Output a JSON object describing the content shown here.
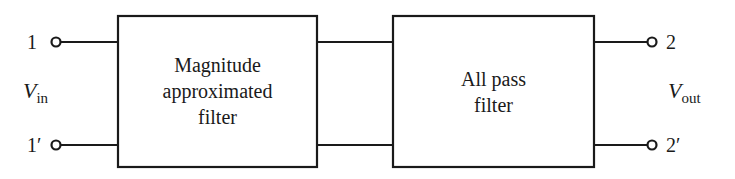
{
  "diagram": {
    "blocks": [
      {
        "id": "magnitude",
        "lines": [
          "Magnitude",
          "approximated",
          "filter"
        ]
      },
      {
        "id": "allpass",
        "lines": [
          "All pass",
          "filter"
        ]
      }
    ],
    "input": {
      "top_terminal": "1",
      "bottom_terminal": "1′",
      "voltage": "V",
      "voltage_sub": "in"
    },
    "output": {
      "top_terminal": "2",
      "bottom_terminal": "2′",
      "voltage": "V",
      "voltage_sub": "out"
    },
    "colors": {
      "line": "#1a1a1a",
      "background": "#ffffff"
    }
  }
}
